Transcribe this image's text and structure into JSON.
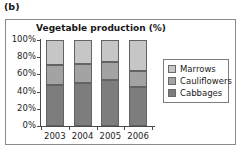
{
  "figure": {
    "label": "(b)"
  },
  "legend": {
    "items": [
      {
        "label": "Marrows",
        "color": "#c6c6c6"
      },
      {
        "label": "Cauliflowers",
        "color": "#a3a3a3"
      },
      {
        "label": "Cabbages",
        "color": "#7d7d7d"
      }
    ]
  },
  "chart_data": {
    "type": "bar",
    "subtype": "stacked-percentage-column",
    "title": "Vegetable production (%)",
    "xlabel": "",
    "ylabel": "",
    "categories": [
      "2003",
      "2004",
      "2005",
      "2006"
    ],
    "ylim": [
      0,
      100
    ],
    "yticks": [
      0,
      20,
      40,
      60,
      80,
      100
    ],
    "ytick_labels": [
      "0%",
      "20%",
      "40%",
      "60%",
      "80%",
      "100%"
    ],
    "grid": false,
    "legend_position": "right",
    "stack_order_bottom_to_top": [
      "Cabbages",
      "Cauliflowers",
      "Marrows"
    ],
    "series": [
      {
        "name": "Cabbages",
        "color": "#7d7d7d",
        "values": [
          48,
          50,
          54,
          45
        ]
      },
      {
        "name": "Cauliflowers",
        "color": "#a3a3a3",
        "values": [
          23,
          22,
          20,
          19
        ]
      },
      {
        "name": "Marrows",
        "color": "#c6c6c6",
        "values": [
          29,
          28,
          26,
          36
        ]
      }
    ],
    "cumulative_tops": {
      "Cabbages": [
        48,
        50,
        54,
        45
      ],
      "Cauliflowers": [
        71,
        72,
        74,
        64
      ],
      "Marrows": [
        100,
        100,
        100,
        100
      ]
    }
  }
}
